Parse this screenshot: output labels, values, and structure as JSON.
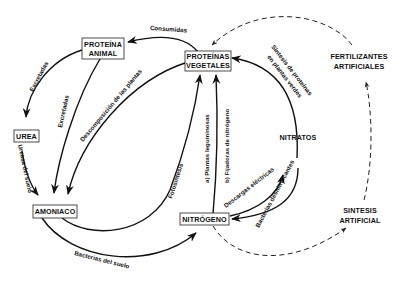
{
  "diagram": {
    "nodes": {
      "proteina_animal": [
        "PROTEÍNA",
        "ANIMAL"
      ],
      "proteinas_vegetales": [
        "PROTEÍNAS",
        "VEGETALES"
      ],
      "fertilizantes": [
        "FERTILIZANTES",
        "ARTIFICIALES"
      ],
      "urea": "UREA",
      "amoniaco": "AMONIACO",
      "nitratos": "NITRATOS",
      "nitrogeno": "NITRÓGENO",
      "sintesis": [
        "SINTESIS",
        "ARTIFICIAL"
      ]
    },
    "edges": {
      "consumidas": "Consumidas",
      "excretadas_urea": "Excretadas",
      "excretadas_amoniaco": "Excretadas",
      "descomposicion": "Descomposición de las plantas",
      "ureasa": "Ureasa del suelo",
      "fotosintesis": "Fotosíntesis",
      "leguminosas": "a) Plantas leguminosas",
      "fijadoras": "b) Fijadoras de nitrógeno",
      "sintesis_proteinas_1": "Síntesis de proteínas",
      "sintesis_proteinas_2": "en plantas verdes",
      "descargas": "Descargas eléctricas",
      "bacterias_desnitrificantes": "Bacterias desnitrificantes",
      "bacterias_suelo": "Bacterias del suelo"
    }
  }
}
